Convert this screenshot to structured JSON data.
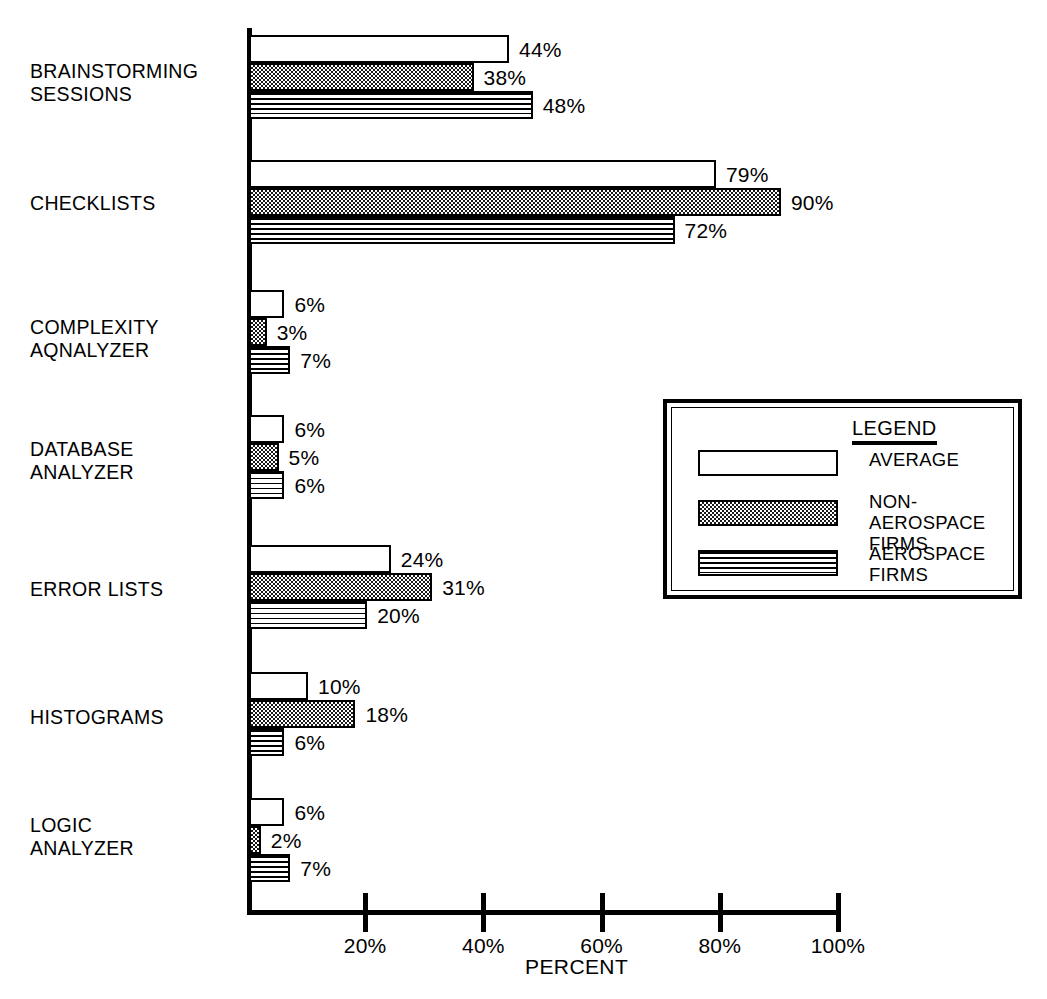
{
  "chart_data": {
    "type": "bar",
    "orientation": "horizontal",
    "title": "",
    "xlabel": "PERCENT",
    "ylabel": "",
    "xlim": [
      0,
      100
    ],
    "xticks": [
      "20%",
      "40%",
      "60%",
      "80%",
      "100%"
    ],
    "xtick_values": [
      20,
      40,
      60,
      80,
      100
    ],
    "grid": false,
    "legend_position": "middle-right",
    "categories": [
      "BRAINSTORMING\nSESSIONS",
      "CHECKLISTS",
      "COMPLEXITY\nAQNALYZER",
      "DATABASE\nANALYZER",
      "ERROR LISTS",
      "HISTOGRAMS",
      "LOGIC\nANALYZER"
    ],
    "series": [
      {
        "name": "AVERAGE",
        "pattern": "white",
        "values": [
          44,
          79,
          6,
          6,
          24,
          10,
          6
        ]
      },
      {
        "name": "NON-AEROSPACE\nFIRMS",
        "pattern": "stipple",
        "values": [
          38,
          90,
          3,
          5,
          31,
          18,
          2
        ]
      },
      {
        "name": "AEROSPACE\nFIRMS",
        "pattern": "stripes",
        "values": [
          48,
          72,
          7,
          6,
          20,
          6,
          7
        ]
      }
    ],
    "value_labels": [
      [
        "44%",
        "38%",
        "48%"
      ],
      [
        "79%",
        "90%",
        "72%"
      ],
      [
        "6%",
        "3%",
        "7%"
      ],
      [
        "6%",
        "5%",
        "6%"
      ],
      [
        "24%",
        "31%",
        "20%"
      ],
      [
        "10%",
        "18%",
        "6%"
      ],
      [
        "6%",
        "2%",
        "7%"
      ]
    ]
  },
  "legend": {
    "title": "LEGEND",
    "entries": [
      {
        "label": "AVERAGE"
      },
      {
        "label": "NON-AEROSPACE\nFIRMS"
      },
      {
        "label": "AEROSPACE\nFIRMS"
      }
    ]
  },
  "colors": {
    "ink": "#000000",
    "paper": "#ffffff",
    "stipple": "#1a1a1a"
  }
}
